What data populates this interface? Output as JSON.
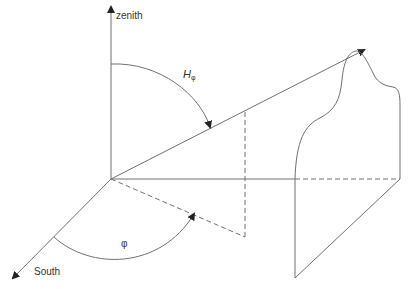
{
  "diagram": {
    "type": "3d-coordinate-geometry",
    "labels": {
      "zenith": "zenith",
      "south": "South",
      "h_symbol": "H",
      "h_subscript": "φ",
      "phi": "φ"
    },
    "colors": {
      "line": "#707070",
      "arrow": "#222222",
      "text": "#333333"
    }
  }
}
